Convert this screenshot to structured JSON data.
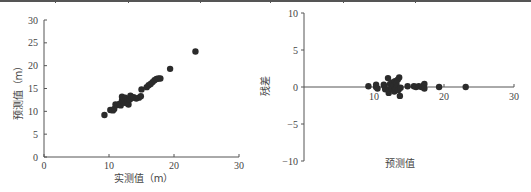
{
  "table_border": {
    "separators_x": [
      55,
      128,
      200,
      270,
      343,
      415
    ]
  },
  "chart_data": [
    {
      "type": "scatter",
      "title": "",
      "xlabel": "实测值（m）",
      "ylabel": "预测值（m）",
      "xlim": [
        0,
        30
      ],
      "ylim": [
        0,
        30
      ],
      "xticks": [
        0,
        10,
        20,
        30
      ],
      "yticks": [
        0,
        5,
        10,
        15,
        20,
        25,
        30
      ],
      "grid": false,
      "legend": null,
      "marker_color": "#2b2b2b",
      "points": [
        [
          9.3,
          9.2
        ],
        [
          10.2,
          10.3
        ],
        [
          10.6,
          10.2
        ],
        [
          10.8,
          10.5
        ],
        [
          11.0,
          11.5
        ],
        [
          11.3,
          11.4
        ],
        [
          11.6,
          11.6
        ],
        [
          11.8,
          11.3
        ],
        [
          12.0,
          12.4
        ],
        [
          12.0,
          13.2
        ],
        [
          12.2,
          12.0
        ],
        [
          12.3,
          12.8
        ],
        [
          12.5,
          13.0
        ],
        [
          12.6,
          11.8
        ],
        [
          12.8,
          12.3
        ],
        [
          13.0,
          11.5
        ],
        [
          13.2,
          12.6
        ],
        [
          13.3,
          13.4
        ],
        [
          13.5,
          12.9
        ],
        [
          13.8,
          13.1
        ],
        [
          14.2,
          12.8
        ],
        [
          14.6,
          13.0
        ],
        [
          14.9,
          13.3
        ],
        [
          15.0,
          14.8
        ],
        [
          15.8,
          15.3
        ],
        [
          16.1,
          15.7
        ],
        [
          16.4,
          16.0
        ],
        [
          16.7,
          16.4
        ],
        [
          17.0,
          16.8
        ],
        [
          17.3,
          17.1
        ],
        [
          17.6,
          17.2
        ],
        [
          17.9,
          17.2
        ],
        [
          19.4,
          19.3
        ],
        [
          23.3,
          23.1
        ]
      ]
    },
    {
      "type": "scatter",
      "title": "",
      "xlabel": "预测值",
      "ylabel": "残差",
      "xlim": [
        0,
        30
      ],
      "ylim": [
        -10,
        10
      ],
      "xticks": [
        10,
        20,
        30
      ],
      "yticks": [
        -10,
        -5,
        0,
        5,
        10
      ],
      "grid": false,
      "legend": null,
      "marker_color": "#2b2b2b",
      "points": [
        [
          9.2,
          0.1
        ],
        [
          10.3,
          0.0
        ],
        [
          10.3,
          0.3
        ],
        [
          10.5,
          -0.2
        ],
        [
          11.5,
          0.1
        ],
        [
          11.6,
          -0.3
        ],
        [
          11.4,
          0.3
        ],
        [
          12.0,
          1.2
        ],
        [
          12.1,
          -0.8
        ],
        [
          12.1,
          -0.4
        ],
        [
          12.3,
          0.4
        ],
        [
          12.5,
          -0.2
        ],
        [
          12.6,
          0.6
        ],
        [
          12.8,
          0.2
        ],
        [
          12.9,
          -0.6
        ],
        [
          13.0,
          0.8
        ],
        [
          13.1,
          -0.2
        ],
        [
          13.2,
          0.5
        ],
        [
          13.3,
          0.0
        ],
        [
          13.4,
          1.0
        ],
        [
          13.5,
          -0.4
        ],
        [
          13.6,
          1.3
        ],
        [
          13.7,
          -1.2
        ],
        [
          13.8,
          -0.1
        ],
        [
          14.8,
          0.1
        ],
        [
          15.7,
          0.1
        ],
        [
          16.0,
          0.0
        ],
        [
          16.4,
          0.1
        ],
        [
          16.8,
          0.0
        ],
        [
          17.1,
          0.2
        ],
        [
          17.2,
          0.4
        ],
        [
          17.2,
          -0.2
        ],
        [
          19.3,
          0.0
        ],
        [
          23.1,
          0.0
        ]
      ]
    }
  ]
}
